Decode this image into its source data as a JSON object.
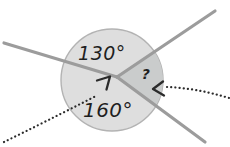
{
  "diagram": {
    "labels": {
      "top_angle": "130°",
      "bottom_angle": "160°",
      "unknown_angle": "?"
    },
    "angles": {
      "top_degrees": 130,
      "bottom_degrees": 160,
      "unknown": "?"
    },
    "colors": {
      "background": "#ffffff",
      "circle_fill": "#dedede",
      "sector_fill": "#cacccc",
      "circle_outline": "#b3b3b3",
      "ray": "#9c9c9c",
      "annotation": "#2b2b2b",
      "label_text": "#1f1f1f"
    },
    "icons": {
      "vertex_arrowhead": "chevron-up-right",
      "sector_arrowhead": "chevron-left"
    }
  }
}
